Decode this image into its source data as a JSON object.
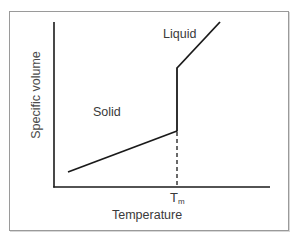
{
  "diagram": {
    "type": "phase-transition-line-diagram",
    "x_axis_label": "Temperature",
    "y_axis_label": "Specific volume",
    "marker_label_base": "T",
    "marker_label_sub": "m",
    "segments": [
      {
        "name": "solid",
        "label": "Solid",
        "from": [
          68,
          172
        ],
        "to": [
          177,
          131
        ]
      },
      {
        "name": "melting-jump",
        "label": "",
        "from": [
          177,
          131
        ],
        "to": [
          177,
          68
        ]
      },
      {
        "name": "liquid",
        "label": "Liquid",
        "from": [
          177,
          68
        ],
        "to": [
          220,
          22
        ]
      }
    ],
    "guide_line": {
      "style": "dashed",
      "from": [
        177,
        131
      ],
      "to": [
        177,
        187
      ]
    },
    "colors": {
      "line": "#1a1a1a",
      "frame": "#9a9a9a",
      "text": "#3a3a3a"
    }
  }
}
